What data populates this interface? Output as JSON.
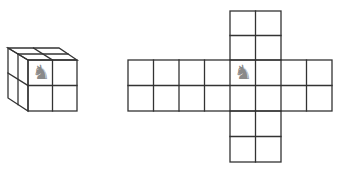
{
  "diagram": {
    "line_color": "#333333",
    "piece_color": "#8a8a8a",
    "cube": {
      "grid": "2x2 per face",
      "visible_faces": [
        "front",
        "top",
        "left"
      ],
      "piece": {
        "name": "knight",
        "glyph": "♞",
        "face": "front",
        "row": 0,
        "col": 0
      }
    },
    "net": {
      "horizontal_strip": {
        "rows": 2,
        "cols": 8
      },
      "vertical_strip": {
        "rows": 6,
        "cols": 2,
        "column_start": 4
      },
      "piece": {
        "name": "knight",
        "glyph": "♞",
        "row": 0,
        "col": 4
      }
    }
  }
}
